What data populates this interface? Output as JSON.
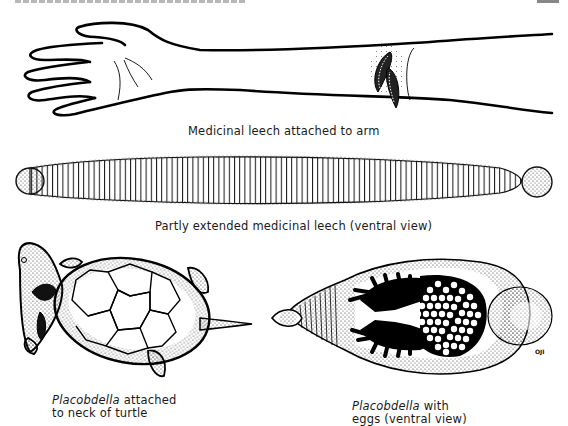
{
  "page": {
    "header_text": "",
    "page_number": ""
  },
  "figures": [
    {
      "id": "arm",
      "caption": "Medicinal leech attached to arm"
    },
    {
      "id": "extended-leech",
      "caption": "Partly extended medicinal leech (ventral view)"
    },
    {
      "id": "turtle",
      "caption_italic": "Placobdella",
      "caption_rest_line1": " attached",
      "caption_line2": "to neck of turtle"
    },
    {
      "id": "eggs",
      "caption_italic": "Placobdella",
      "caption_rest_line1": " with",
      "caption_line2": "eggs (ventral view)"
    }
  ],
  "artist_initials": "OJI"
}
